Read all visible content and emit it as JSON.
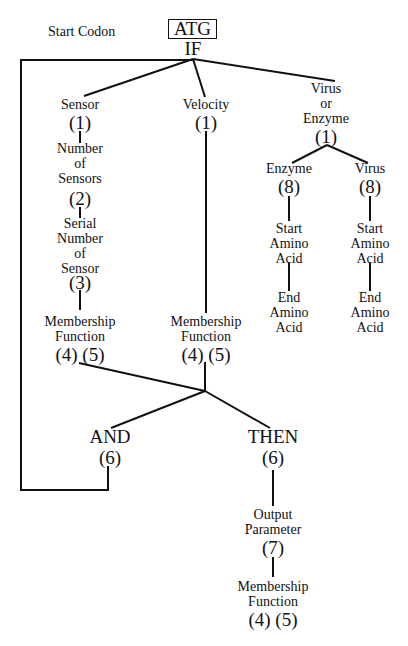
{
  "header": {
    "start_codon_label": "Start Codon",
    "codon": "ATG",
    "if_keyword": "IF"
  },
  "branches": {
    "sensor": {
      "label": "Sensor",
      "code": "(1)",
      "children": [
        {
          "lines": [
            "Number",
            "of",
            "Sensors"
          ],
          "code": "(2)"
        },
        {
          "lines": [
            "Serial",
            "Number",
            "of",
            "Sensor"
          ],
          "code": "(3)"
        },
        {
          "lines": [
            "Membership",
            "Function"
          ],
          "code": "(4) (5)"
        }
      ]
    },
    "velocity": {
      "label": "Velocity",
      "code": "(1)",
      "membership": {
        "lines": [
          "Membership",
          "Function"
        ],
        "code": "(4) (5)"
      }
    },
    "virus_or_enzyme": {
      "lines": [
        "Virus",
        "or",
        "Enzyme"
      ],
      "code": "(1)",
      "enzyme": {
        "label": "Enzyme",
        "code": "(8)",
        "start": [
          "Start",
          "Amino",
          "Acid"
        ],
        "end": [
          "End",
          "Amino",
          "Acid"
        ]
      },
      "virus": {
        "label": "Virus",
        "code": "(8)",
        "start": [
          "Start",
          "Amino",
          "Acid"
        ],
        "end": [
          "End",
          "Amino",
          "Acid"
        ]
      }
    }
  },
  "logic": {
    "and": {
      "label": "AND",
      "code": "(6)"
    },
    "then": {
      "label": "THEN",
      "code": "(6)"
    }
  },
  "output": {
    "parameter": {
      "lines": [
        "Output",
        "Parameter"
      ],
      "code": "(7)"
    },
    "membership": {
      "lines": [
        "Membership",
        "Function"
      ],
      "code": "(4) (5)"
    }
  }
}
